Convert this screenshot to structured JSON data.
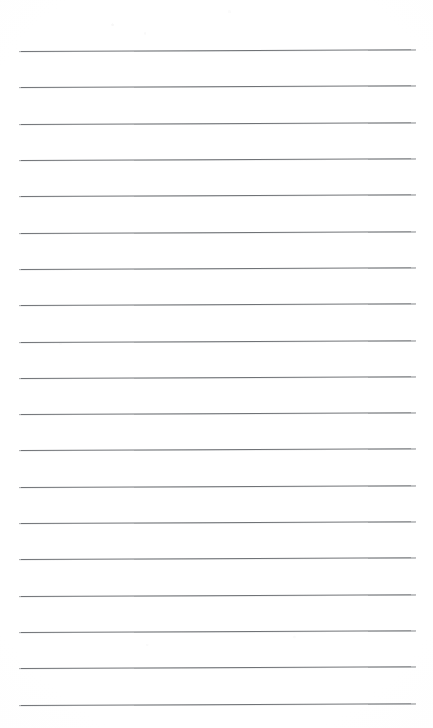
{
  "document": {
    "type": "scanned-lined-paper",
    "title": "Blank ruled notepad page",
    "page_width": 433,
    "page_height": 728,
    "background_color": "#ffffff",
    "text_content": "",
    "has_handwriting": false,
    "has_printed_text": false
  },
  "ruling": {
    "line_color": "#6f7276",
    "line_thickness_px": 1,
    "line_count": 19,
    "left_margin_px": 19,
    "right_margin_px": 17,
    "line_left_x": 19,
    "line_right_x": 416,
    "line_length_px": 397,
    "first_line_y": 50,
    "last_line_y": 704,
    "line_spacing_px": 36.3,
    "skew_degrees": -0.17,
    "top_blank_margin_px": 50,
    "bottom_blank_margin_px": 24,
    "lines": [
      {
        "index": 1,
        "y": 50.0,
        "left_y": 51.0,
        "right_y": 49.3
      },
      {
        "index": 2,
        "y": 86.3,
        "left_y": 87.3,
        "right_y": 85.6
      },
      {
        "index": 3,
        "y": 122.6,
        "left_y": 123.6,
        "right_y": 121.9
      },
      {
        "index": 4,
        "y": 158.9,
        "left_y": 159.9,
        "right_y": 158.2
      },
      {
        "index": 5,
        "y": 195.2,
        "left_y": 196.2,
        "right_y": 194.5
      },
      {
        "index": 6,
        "y": 231.6,
        "left_y": 232.6,
        "right_y": 230.9
      },
      {
        "index": 7,
        "y": 267.9,
        "left_y": 268.9,
        "right_y": 267.2
      },
      {
        "index": 8,
        "y": 304.2,
        "left_y": 305.2,
        "right_y": 303.5
      },
      {
        "index": 9,
        "y": 340.5,
        "left_y": 341.5,
        "right_y": 339.8
      },
      {
        "index": 10,
        "y": 376.8,
        "left_y": 377.8,
        "right_y": 376.1
      },
      {
        "index": 11,
        "y": 413.1,
        "left_y": 414.1,
        "right_y": 412.4
      },
      {
        "index": 12,
        "y": 449.4,
        "left_y": 450.4,
        "right_y": 448.7
      },
      {
        "index": 13,
        "y": 485.8,
        "left_y": 486.8,
        "right_y": 485.1
      },
      {
        "index": 14,
        "y": 522.1,
        "left_y": 523.1,
        "right_y": 521.4
      },
      {
        "index": 15,
        "y": 558.4,
        "left_y": 559.4,
        "right_y": 557.7
      },
      {
        "index": 16,
        "y": 594.7,
        "left_y": 595.7,
        "right_y": 594.0
      },
      {
        "index": 17,
        "y": 631.0,
        "left_y": 632.0,
        "right_y": 630.3
      },
      {
        "index": 18,
        "y": 667.3,
        "left_y": 668.3,
        "right_y": 666.6
      },
      {
        "index": 19,
        "y": 703.7,
        "left_y": 704.7,
        "right_y": 703.0
      }
    ]
  }
}
